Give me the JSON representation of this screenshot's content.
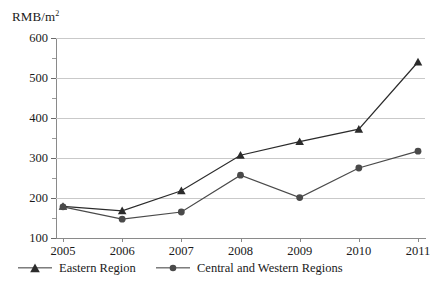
{
  "chart_data": {
    "type": "line",
    "title": "",
    "ylabel": "RMB/m",
    "ylabel_sup": "2",
    "xlabel": "",
    "categories": [
      "2005",
      "2006",
      "2007",
      "2008",
      "2009",
      "2010",
      "2011"
    ],
    "series": [
      {
        "name": "Eastern Region",
        "marker": "triangle",
        "color": "#2b2b2b",
        "values": [
          179,
          168,
          218,
          307,
          341,
          372,
          540
        ]
      },
      {
        "name": "Central and Western Regions",
        "marker": "circle",
        "color": "#4a4a4a",
        "values": [
          178,
          147,
          165,
          257,
          201,
          275,
          317
        ]
      }
    ],
    "ylim": [
      100,
      600
    ],
    "ytick_labels": [
      "600",
      "500",
      "400",
      "300",
      "200",
      "100"
    ],
    "ytick_values": [
      600,
      500,
      400,
      300,
      200,
      100
    ],
    "yminor_values": [
      550,
      450,
      350,
      250,
      150
    ],
    "grid": "horizontal",
    "gridline_color": "#c9c9c9",
    "axis_color": "#8a8a8a",
    "background": "#ffffff",
    "legend_position": "bottom"
  },
  "legend": {
    "entries": [
      {
        "label": "Eastern Region"
      },
      {
        "label": "Central and Western Regions"
      }
    ]
  }
}
